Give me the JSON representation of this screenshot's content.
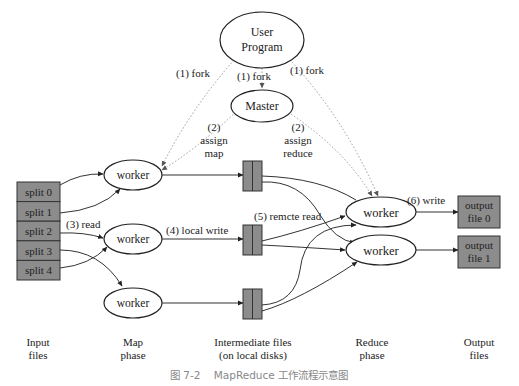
{
  "diagram": {
    "user_program": {
      "line1": "User",
      "line2": "Program"
    },
    "master": {
      "label": "Master"
    },
    "edge_labels": {
      "fork_left": "(1)  fork",
      "fork_center": "(1)  fork",
      "fork_right": "(1)  fork",
      "assign_map": {
        "line1": "(2)",
        "line2": "assign",
        "line3": "map"
      },
      "assign_reduce": {
        "line1": "(2)",
        "line2": "assign",
        "line3": "reduce"
      },
      "read": "(3)  read",
      "local_write": "(4)  local write",
      "remote_read": "(5)  remcte read",
      "write": "(6)  write"
    },
    "splits": [
      "split 0",
      "split 1",
      "split 2",
      "split 3",
      "split 4"
    ],
    "map_workers": [
      "worker",
      "worker",
      "worker"
    ],
    "reduce_workers": [
      "worker",
      "worker"
    ],
    "outputs": [
      {
        "line1": "output",
        "line2": "file 0"
      },
      {
        "line1": "output",
        "line2": "file 1"
      }
    ],
    "phases": [
      {
        "line1": "Input",
        "line2": "files"
      },
      {
        "line1": "Map",
        "line2": "phase"
      },
      {
        "line1": "Intermediate files",
        "line2": "(on local disks)"
      },
      {
        "line1": "Reduce",
        "line2": "phase"
      },
      {
        "line1": "Output",
        "line2": "files"
      }
    ],
    "caption": "图 7-2    MapReduce 工作流程示意图",
    "colors": {
      "box_fill": "#8c8c8c",
      "line": "#333333",
      "dotted": "#9a9a9a",
      "caption": "#888888"
    }
  }
}
